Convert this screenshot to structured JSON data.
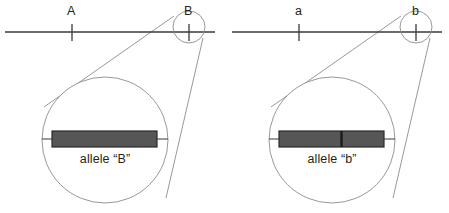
{
  "figure": {
    "title": "",
    "background_color": "#ffffff",
    "line_color": "#3a3a3a",
    "circle_color": "#8c8c8c",
    "bar_fill_color": "#565656",
    "bar_stroke_color": "#2b2b2b",
    "text_color": "#231f20"
  },
  "panels": [
    {
      "id": "dominant-allele-panel",
      "chromosome": {
        "name": "chromosome-line",
        "x1": 5,
        "x2": 215,
        "y": 32
      },
      "loci": [
        {
          "name": "locus-tick-a",
          "label": "A",
          "x": 72,
          "label_x": 67,
          "label_y": 8
        },
        {
          "name": "locus-tick-b",
          "label": "B",
          "x": 189,
          "label_x": 184,
          "label_y": 8
        }
      ],
      "magnifier_small": {
        "name": "small-magnifier-circle",
        "cx": 189,
        "cy": 27,
        "r": 16
      },
      "magnifier_large": {
        "name": "large-magnifier-circle",
        "cx": 105,
        "cy": 140,
        "r": 63
      },
      "allele": {
        "name": "allele-bar",
        "label": "allele “B”",
        "label_x": 105,
        "label_y": 160,
        "bar_x": 52,
        "bar_y": 131,
        "bar_w": 105,
        "bar_h": 16,
        "segments": 1,
        "divider_fraction": null,
        "stub_left_x": 42,
        "stub_right_x": 168
      }
    },
    {
      "id": "recessive-allele-panel",
      "chromosome": {
        "name": "chromosome-line",
        "x1": 232,
        "x2": 442,
        "y": 32
      },
      "loci": [
        {
          "name": "locus-tick-a",
          "label": "a",
          "x": 299,
          "label_x": 295,
          "label_y": 8
        },
        {
          "name": "locus-tick-b",
          "label": "b",
          "x": 416,
          "label_x": 412,
          "label_y": 8
        }
      ],
      "magnifier_small": {
        "name": "small-magnifier-circle",
        "cx": 416,
        "cy": 27,
        "r": 16
      },
      "magnifier_large": {
        "name": "large-magnifier-circle",
        "cx": 332,
        "cy": 140,
        "r": 63
      },
      "allele": {
        "name": "allele-bar",
        "label": "allele “b”",
        "label_x": 332,
        "label_y": 160,
        "bar_x": 279,
        "bar_y": 131,
        "bar_w": 105,
        "bar_h": 16,
        "segments": 2,
        "divider_fraction": 0.59,
        "stub_left_x": 269,
        "stub_right_x": 395
      }
    }
  ]
}
